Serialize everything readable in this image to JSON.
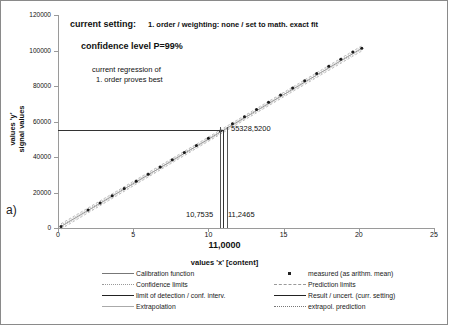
{
  "figure": {
    "panel_label": "a)"
  },
  "annotations": {
    "setting_label": "current setting:",
    "setting_value": "1. order / weighting: none / set to math. exact fit",
    "confidence_level": "confidence level P=99%",
    "regression_note_line1": "current regression of",
    "regression_note_line2": "1. order proves best",
    "result_y": "55328,5200",
    "result_x_low": "10,7535",
    "result_x_high": "11,2465",
    "result_x": "11,0000"
  },
  "legend": {
    "left": [
      {
        "label": "Calibration function",
        "key": "line-solid-thin"
      },
      {
        "label": "Confidence limits",
        "key": "line-dotted"
      },
      {
        "label": "limit of detection / conf. interv.",
        "key": "line-solid-thick"
      },
      {
        "label": "Extrapolation",
        "key": "line-solid-light"
      }
    ],
    "right": [
      {
        "label": "measured (as arithm. mean)",
        "key": "marker-point"
      },
      {
        "label": "Prediction limits",
        "key": "line-dashed"
      },
      {
        "label": "Result / uncert. (curr. setting)",
        "key": "line-solid-thick"
      },
      {
        "label": "extrapol. prediction",
        "key": "line-dots-sparse"
      }
    ]
  },
  "chart_data": {
    "type": "scatter",
    "title": "",
    "xlabel": "values 'x' [content]",
    "ylabel_line1": "values 'y'",
    "ylabel_line2": "signal values",
    "xlim": [
      0,
      25
    ],
    "ylim": [
      0,
      120000
    ],
    "xticks": [
      0,
      5,
      10,
      15,
      20,
      25
    ],
    "yticks": [
      0,
      20000,
      40000,
      60000,
      80000,
      100000,
      120000
    ],
    "xticklabels": [
      "0",
      "5",
      "10",
      "15",
      "20",
      "25"
    ],
    "yticklabels": [
      "0",
      "20000",
      "40000",
      "60000",
      "80000",
      "100000",
      "120000"
    ],
    "grid": false,
    "legend_position": "bottom",
    "series": [
      {
        "name": "measured (as arithm. mean)",
        "type": "scatter",
        "x": [
          0.2,
          2.0,
          2.8,
          3.6,
          4.4,
          5.2,
          6.0,
          6.8,
          7.6,
          8.4,
          9.2,
          10.0,
          10.8,
          11.6,
          12.4,
          13.2,
          14.0,
          14.8,
          15.6,
          16.4,
          17.2,
          18.0,
          18.8,
          19.6,
          20.2
        ],
        "y": [
          900,
          10100,
          14100,
          18200,
          22200,
          26300,
          30300,
          34400,
          38400,
          42500,
          46500,
          50600,
          54600,
          58700,
          62700,
          66800,
          70800,
          74900,
          78900,
          83000,
          87000,
          91100,
          95100,
          99200,
          101200
        ]
      },
      {
        "name": "Calibration function",
        "type": "line",
        "x": [
          0.2,
          20.2
        ],
        "y": [
          900,
          101200
        ]
      },
      {
        "name": "Result / uncert. (curr. setting)",
        "type": "reference",
        "y_result": 55328.52,
        "x_result": 11.0,
        "x_low": 10.7535,
        "x_high": 11.2465
      }
    ]
  }
}
